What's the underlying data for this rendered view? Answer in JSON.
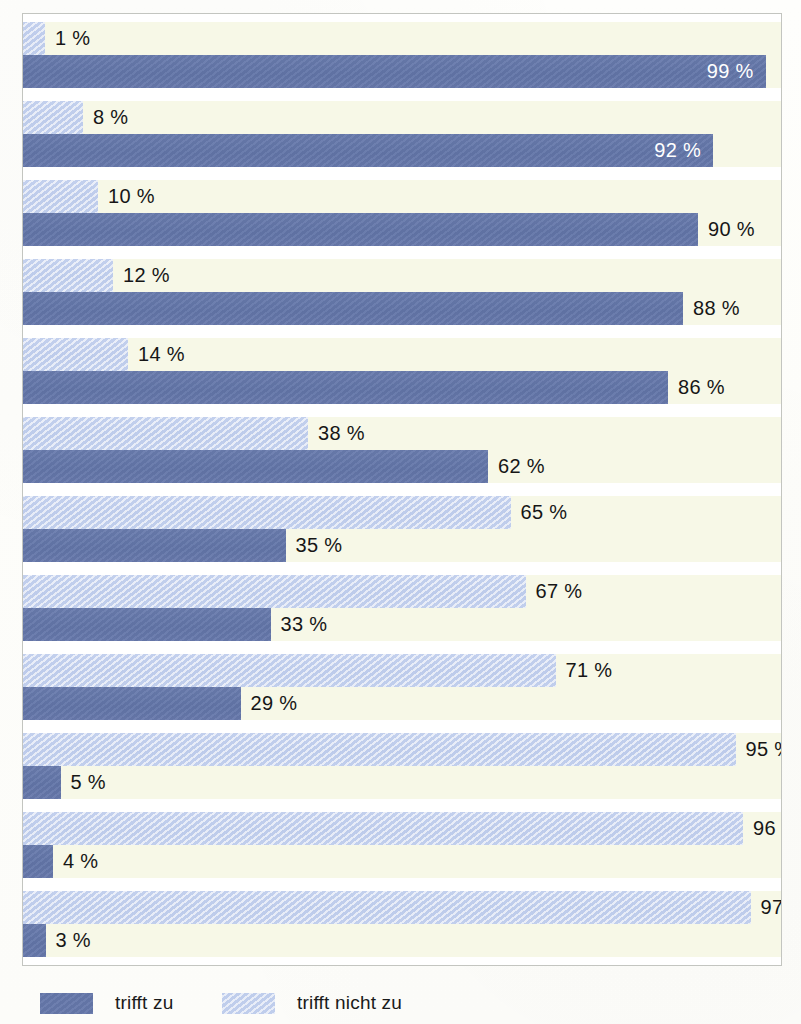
{
  "chart_data": {
    "type": "bar",
    "orientation": "horizontal",
    "title": "",
    "subtitle": "",
    "xlabel": "",
    "ylabel": "",
    "xlim": [
      0,
      100
    ],
    "grid": false,
    "value_suffix": "%",
    "legend_position": "bottom-left",
    "categories": [
      "Item 1",
      "Item 2",
      "Item 3",
      "Item 4",
      "Item 5",
      "Item 6",
      "Item 7",
      "Item 8",
      "Item 9",
      "Item 10",
      "Item 11",
      "Item 12"
    ],
    "series": [
      {
        "name": "trifft nicht zu",
        "color": "#ccd7ef",
        "values": [
          1,
          8,
          10,
          12,
          14,
          38,
          65,
          67,
          71,
          95,
          96,
          97
        ]
      },
      {
        "name": "trifft zu",
        "color": "#6678ab",
        "values": [
          99,
          92,
          90,
          88,
          86,
          62,
          35,
          33,
          29,
          5,
          4,
          3
        ]
      }
    ],
    "groups": [
      {
        "light": {
          "value": 1,
          "label": "1 %",
          "label_inside": false
        },
        "dark": {
          "value": 99,
          "label": "99 %",
          "label_inside": true
        }
      },
      {
        "light": {
          "value": 8,
          "label": "8 %",
          "label_inside": false
        },
        "dark": {
          "value": 92,
          "label": "92 %",
          "label_inside": true
        }
      },
      {
        "light": {
          "value": 10,
          "label": "10 %",
          "label_inside": false
        },
        "dark": {
          "value": 90,
          "label": "90 %",
          "label_inside": false
        }
      },
      {
        "light": {
          "value": 12,
          "label": "12 %",
          "label_inside": false
        },
        "dark": {
          "value": 88,
          "label": "88 %",
          "label_inside": false
        }
      },
      {
        "light": {
          "value": 14,
          "label": "14 %",
          "label_inside": false
        },
        "dark": {
          "value": 86,
          "label": "86 %",
          "label_inside": false
        }
      },
      {
        "light": {
          "value": 38,
          "label": "38 %",
          "label_inside": false
        },
        "dark": {
          "value": 62,
          "label": "62 %",
          "label_inside": false
        }
      },
      {
        "light": {
          "value": 65,
          "label": "65 %",
          "label_inside": false
        },
        "dark": {
          "value": 35,
          "label": "35 %",
          "label_inside": false
        }
      },
      {
        "light": {
          "value": 67,
          "label": "67 %",
          "label_inside": false
        },
        "dark": {
          "value": 33,
          "label": "33 %",
          "label_inside": false
        }
      },
      {
        "light": {
          "value": 71,
          "label": "71 %",
          "label_inside": false
        },
        "dark": {
          "value": 29,
          "label": "29 %",
          "label_inside": false
        }
      },
      {
        "light": {
          "value": 95,
          "label": "95 %",
          "label_inside": false
        },
        "dark": {
          "value": 5,
          "label": "5 %",
          "label_inside": false
        }
      },
      {
        "light": {
          "value": 96,
          "label": "96 %",
          "label_inside": false
        },
        "dark": {
          "value": 4,
          "label": "4 %",
          "label_inside": false
        }
      },
      {
        "light": {
          "value": 97,
          "label": "97 %",
          "label_inside": false
        },
        "dark": {
          "value": 3,
          "label": "3 %",
          "label_inside": false
        }
      }
    ]
  },
  "legend": {
    "items": [
      {
        "label": "trifft zu",
        "color": "#6678ab",
        "style": "dark"
      },
      {
        "label": "trifft nicht zu",
        "color": "#ccd7ef",
        "style": "light"
      }
    ]
  },
  "colors": {
    "bar_dark": "#6678ab",
    "bar_light": "#ccd7ef",
    "band_background": "#f7f8e7",
    "frame_border": "#c3c5c0",
    "page_background": "#fdfdfb",
    "label_text": "#1c1c1c",
    "label_text_inside": "#ffffff"
  }
}
